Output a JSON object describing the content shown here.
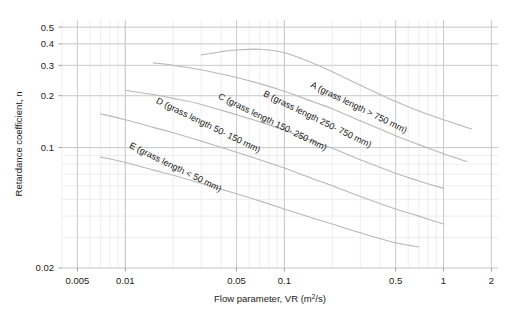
{
  "chart_data": {
    "type": "line",
    "title": "",
    "xlabel": "Flow parameter, VR (m2/s)",
    "xlabel_base": "Flow parameter, VR (m",
    "xlabel_sup": "2",
    "xlabel_tail": "/s)",
    "ylabel": "Retardance coefficient, n",
    "xscale": "log",
    "yscale": "log",
    "xlim": [
      0.004,
      2.2
    ],
    "ylim": [
      0.02,
      0.55
    ],
    "grid": true,
    "grid_minor": true,
    "legend_position": "inline-labels",
    "xticks": [
      0.005,
      0.01,
      0.05,
      0.1,
      0.5,
      1,
      2
    ],
    "xtick_labels": [
      "0.005",
      "0.01",
      "0.05",
      "0.1",
      "0.5",
      "1",
      "2"
    ],
    "yticks": [
      0.02,
      0.1,
      0.2,
      0.3,
      0.4,
      0.5
    ],
    "ytick_labels": [
      "0.02",
      "0.1",
      "0.2",
      "0.3",
      "0.4",
      "0.5"
    ],
    "series": [
      {
        "name": "A",
        "label": "A (grass length > 750 mm)",
        "label_x": 0.145,
        "label_y": 0.225,
        "label_rotation": 26,
        "x": [
          0.03,
          0.04,
          0.05,
          0.07,
          0.1,
          0.15,
          0.2,
          0.3,
          0.5,
          0.7,
          1.0,
          1.5
        ],
        "y": [
          0.345,
          0.36,
          0.368,
          0.372,
          0.355,
          0.31,
          0.275,
          0.23,
          0.185,
          0.163,
          0.145,
          0.128
        ]
      },
      {
        "name": "B",
        "label": "B (grass length 250- 750 mm)",
        "label_x": 0.073,
        "label_y": 0.2,
        "label_rotation": 26,
        "x": [
          0.015,
          0.02,
          0.03,
          0.05,
          0.07,
          0.1,
          0.15,
          0.2,
          0.3,
          0.5,
          0.7,
          1.0,
          1.4
        ],
        "y": [
          0.31,
          0.3,
          0.283,
          0.255,
          0.235,
          0.212,
          0.185,
          0.168,
          0.143,
          0.117,
          0.104,
          0.092,
          0.083
        ]
      },
      {
        "name": "C",
        "label": "C (grass length 150- 250 mm)",
        "label_x": 0.038,
        "label_y": 0.193,
        "label_rotation": 26,
        "x": [
          0.01,
          0.015,
          0.02,
          0.03,
          0.05,
          0.07,
          0.1,
          0.15,
          0.2,
          0.3,
          0.5,
          0.7,
          1.0
        ],
        "y": [
          0.215,
          0.203,
          0.193,
          0.178,
          0.155,
          0.141,
          0.126,
          0.109,
          0.099,
          0.085,
          0.071,
          0.064,
          0.058
        ]
      },
      {
        "name": "D",
        "label": "D (grass length 50- 150 mm)",
        "label_x": 0.0155,
        "label_y": 0.182,
        "label_rotation": 26,
        "x": [
          0.007,
          0.01,
          0.015,
          0.02,
          0.03,
          0.05,
          0.07,
          0.1,
          0.15,
          0.2,
          0.3,
          0.5,
          0.7,
          1.0
        ],
        "y": [
          0.157,
          0.145,
          0.131,
          0.122,
          0.109,
          0.094,
          0.085,
          0.076,
          0.066,
          0.06,
          0.052,
          0.044,
          0.04,
          0.036
        ]
      },
      {
        "name": "E",
        "label": "E (grass length < 50 mm)",
        "label_x": 0.0105,
        "label_y": 0.1,
        "label_rotation": 26,
        "x": [
          0.007,
          0.01,
          0.015,
          0.02,
          0.03,
          0.05,
          0.07,
          0.1,
          0.15,
          0.2,
          0.3,
          0.5,
          0.7
        ],
        "y": [
          0.088,
          0.082,
          0.074,
          0.069,
          0.062,
          0.054,
          0.049,
          0.044,
          0.039,
          0.036,
          0.032,
          0.028,
          0.0265
        ]
      }
    ],
    "colors": {
      "curve": "#b8b8b8",
      "grid_major": "#c9c9c9",
      "grid_minor": "#e3e3e3",
      "text": "#1a1a1a",
      "background": "#ffffff"
    }
  }
}
